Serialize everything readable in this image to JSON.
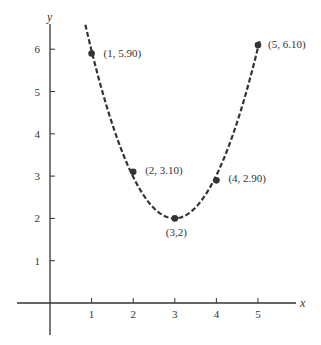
{
  "chart_data": {
    "type": "scatter",
    "title": "",
    "xlabel": "x",
    "ylabel": "y",
    "xlim": [
      -0.8,
      5.9
    ],
    "ylim": [
      -0.8,
      6.6
    ],
    "grid": false,
    "x_ticks": [
      1,
      2,
      3,
      4,
      5
    ],
    "y_ticks": [
      1,
      2,
      3,
      4,
      5,
      6
    ],
    "x_tick_labels": [
      "1",
      "2",
      "3",
      "4",
      "5"
    ],
    "y_tick_labels": [
      "1",
      "2",
      "3",
      "4",
      "5",
      "6"
    ],
    "points": [
      {
        "x": 1,
        "y": 5.9,
        "label": "(1, 5.90)"
      },
      {
        "x": 2,
        "y": 3.1,
        "label": "(2, 3.10)"
      },
      {
        "x": 3,
        "y": 2,
        "label": "(3,2)"
      },
      {
        "x": 4,
        "y": 2.9,
        "label": "(4, 2.90)"
      },
      {
        "x": 5,
        "y": 6.1,
        "label": "(5, 6.10)"
      }
    ],
    "fit_curve": {
      "style": "dashed",
      "description": "least-squares parabola through the points",
      "x_range": [
        0.85,
        5.05
      ]
    },
    "colors": {
      "line": "#333333",
      "point": "#333333",
      "axis": "#333333"
    }
  }
}
